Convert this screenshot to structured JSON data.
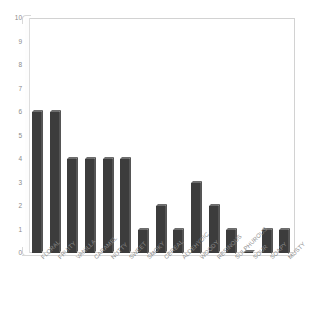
{
  "chart_data": {
    "type": "bar",
    "title": "",
    "subtitle": "",
    "xlabel": "",
    "ylabel": "",
    "ylim": [
      0,
      10
    ],
    "ytick_labels": [
      "10",
      "9",
      "8",
      "7",
      "6",
      "5",
      "4",
      "3",
      "2",
      "1",
      "0"
    ],
    "yticks": [
      10,
      9,
      8,
      7,
      6,
      5,
      4,
      3,
      2,
      1,
      0
    ],
    "grid": false,
    "legend": false,
    "legend_position": "none",
    "bar_color": "#3c3c3c",
    "categories": [
      "FLORAL",
      "FRUITY",
      "VANILLA",
      "CARAMEL",
      "NUTTY",
      "SWEET",
      "SMOKY",
      "CEREAL",
      "ALDEHYDIC",
      "WOODY",
      "RESINOUS",
      "SULPHUROUS",
      "SOUR",
      "SOAPY",
      "MUSTY"
    ],
    "values": [
      6,
      6,
      4,
      4,
      4,
      4,
      1,
      2,
      1,
      3,
      2,
      1,
      0,
      1,
      1
    ]
  }
}
